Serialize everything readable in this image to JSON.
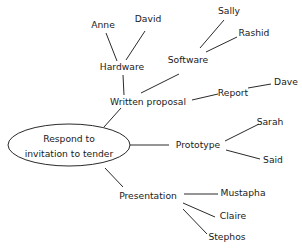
{
  "diagram": {
    "type": "mind-map",
    "root": {
      "label_lines": [
        "Respond to",
        "invitation to tender"
      ]
    },
    "branches": [
      {
        "id": "written-proposal",
        "label": "Written proposal",
        "children": [
          {
            "id": "hardware",
            "label": "Hardware",
            "children": [
              {
                "id": "anne",
                "label": "Anne"
              },
              {
                "id": "david",
                "label": "David"
              }
            ]
          },
          {
            "id": "software",
            "label": "Software",
            "children": [
              {
                "id": "sally",
                "label": "Sally"
              },
              {
                "id": "rashid",
                "label": "Rashid"
              }
            ]
          },
          {
            "id": "report",
            "label": "Report",
            "children": [
              {
                "id": "dave",
                "label": "Dave"
              }
            ]
          }
        ]
      },
      {
        "id": "prototype",
        "label": "Prototype",
        "children": [
          {
            "id": "sarah",
            "label": "Sarah"
          },
          {
            "id": "said",
            "label": "Said"
          }
        ]
      },
      {
        "id": "presentation",
        "label": "Presentation",
        "children": [
          {
            "id": "mustapha",
            "label": "Mustapha"
          },
          {
            "id": "claire",
            "label": "Claire"
          },
          {
            "id": "stephos",
            "label": "Stephos"
          }
        ]
      }
    ],
    "colors": {
      "ink": "#1a1a1a",
      "background": "#ffffff"
    }
  }
}
